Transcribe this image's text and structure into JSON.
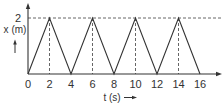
{
  "chart_data": {
    "type": "line",
    "title": "",
    "xlabel": "t (s)",
    "ylabel": "x (m)",
    "x": [
      0,
      2,
      4,
      6,
      8,
      10,
      12,
      14,
      16
    ],
    "series": [
      {
        "name": "x(t)",
        "values": [
          0,
          2,
          0,
          2,
          0,
          2,
          0,
          2,
          0
        ]
      }
    ],
    "xticks": [
      "0",
      "2",
      "4",
      "6",
      "8",
      "10",
      "12",
      "14",
      "16"
    ],
    "yticks": [
      "2"
    ],
    "xlim": [
      0,
      17.5
    ],
    "ylim": [
      0,
      2.6
    ],
    "grid": false,
    "annotations": [
      "dashed horizontal line at x = 2",
      "dashed vertical drop lines at t = 2, 6, 10, 14"
    ]
  },
  "colors": {
    "line": "#333333",
    "dashed": "#555555",
    "text": "#333333"
  }
}
